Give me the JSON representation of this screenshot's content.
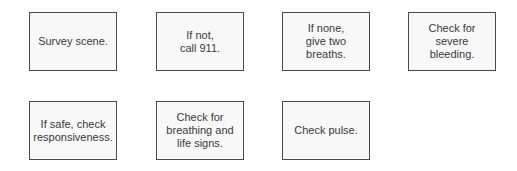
{
  "diagram": {
    "steps": [
      {
        "id": "box-1",
        "text": "Survey scene."
      },
      {
        "id": "box-2",
        "text": "If not,\ncall 911."
      },
      {
        "id": "box-3",
        "text": "If none,\ngive two\nbreaths."
      },
      {
        "id": "box-4",
        "text": "Check for\nsevere\nbleeding."
      },
      {
        "id": "box-5",
        "text": "If safe, check\nresponsiveness."
      },
      {
        "id": "box-6",
        "text": "Check for\nbreathing and\nlife signs."
      },
      {
        "id": "box-7",
        "text": "Check pulse."
      }
    ]
  },
  "colors": {
    "border": "#4a4a4a",
    "fill": "#f8f8f8",
    "text": "#3a3a3a"
  }
}
